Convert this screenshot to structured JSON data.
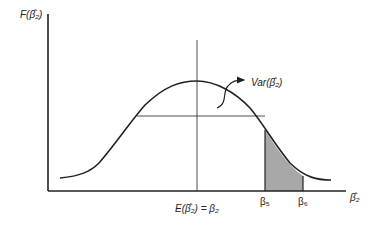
{
  "diagram": {
    "y_axis_label": "F(β̂₂)",
    "x_axis_label": "β̂₂",
    "mean_label": "E(β̂₂) = β₂",
    "variance_label": "Var(β̂₂)",
    "tick_labels": [
      "β₅",
      "β₆"
    ],
    "colors": {
      "line": "#222222",
      "shade": "#a8a8a8",
      "background": "#ffffff"
    }
  }
}
